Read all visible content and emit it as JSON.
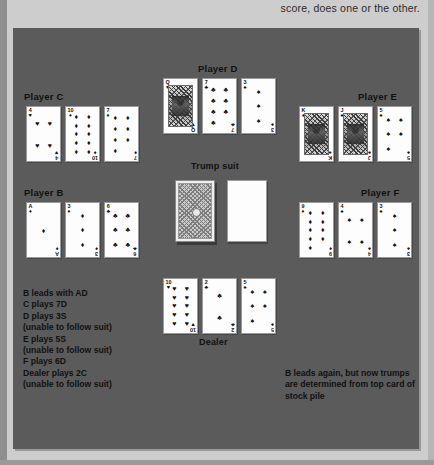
{
  "page": {
    "running_text": "score, does one or the other."
  },
  "table": {
    "seats": [
      {
        "id": "player-c",
        "label": "Player C"
      },
      {
        "id": "player-d",
        "label": "Player D"
      },
      {
        "id": "player-e",
        "label": "Player E"
      },
      {
        "id": "player-b",
        "label": "Player B"
      },
      {
        "id": "player-f",
        "label": "Player F"
      },
      {
        "id": "dealer",
        "label": "Dealer"
      }
    ],
    "trump_label": "Trump suit",
    "stock_pile_icon": "card-back-icon",
    "trump_card_icon": "blank-card-icon"
  },
  "hands": {
    "player_c": [
      {
        "rank": "4",
        "suit": "♥",
        "color": "black",
        "count": 4,
        "court": false
      },
      {
        "rank": "10",
        "suit": "♦",
        "color": "black",
        "count": 10,
        "court": false
      },
      {
        "rank": "7",
        "suit": "♦",
        "color": "black",
        "count": 7,
        "court": false
      }
    ],
    "player_d": [
      {
        "rank": "Q",
        "suit": "♥",
        "color": "black",
        "count": 0,
        "court": true
      },
      {
        "rank": "7",
        "suit": "♣",
        "color": "black",
        "count": 7,
        "court": false
      },
      {
        "rank": "3",
        "suit": "♠",
        "color": "black",
        "count": 3,
        "court": false
      }
    ],
    "player_e": [
      {
        "rank": "K",
        "suit": "♠",
        "color": "black",
        "count": 0,
        "court": true
      },
      {
        "rank": "J",
        "suit": "♠",
        "color": "black",
        "count": 0,
        "court": true
      },
      {
        "rank": "5",
        "suit": "♠",
        "color": "black",
        "count": 5,
        "court": false
      }
    ],
    "player_b": [
      {
        "rank": "A",
        "suit": "♦",
        "color": "black",
        "count": 1,
        "court": false
      },
      {
        "rank": "3",
        "suit": "♦",
        "color": "black",
        "count": 3,
        "court": false
      },
      {
        "rank": "6",
        "suit": "♣",
        "color": "black",
        "count": 6,
        "court": false
      }
    ],
    "player_f": [
      {
        "rank": "9",
        "suit": "♦",
        "color": "black",
        "count": 9,
        "court": false
      },
      {
        "rank": "4",
        "suit": "♠",
        "color": "black",
        "count": 4,
        "court": false
      },
      {
        "rank": "3",
        "suit": "♠",
        "color": "black",
        "count": 3,
        "court": false
      }
    ],
    "dealer": [
      {
        "rank": "10",
        "suit": "♥",
        "color": "black",
        "count": 10,
        "court": false
      },
      {
        "rank": "2",
        "suit": "♣",
        "color": "black",
        "count": 2,
        "court": false
      },
      {
        "rank": "5",
        "suit": "♠",
        "color": "black",
        "count": 5,
        "court": false
      }
    ]
  },
  "notes": {
    "play_sequence": [
      "B leads with AD",
      "C plays 7D",
      "D plays 3S",
      " (unable to follow suit)",
      "E plays 5S",
      " (unable to follow suit)",
      "F plays 6D",
      "Dealer plays 2C",
      " (unable to follow suit)"
    ],
    "trump_note": [
      "B leads again, but now trumps",
      "are determined from top card of",
      "stock pile"
    ]
  },
  "colors": {
    "table_green": "#5b5b5b",
    "page_background": "#cdcdcd",
    "card_face": "#fdfdfd",
    "ink": "#111111"
  }
}
